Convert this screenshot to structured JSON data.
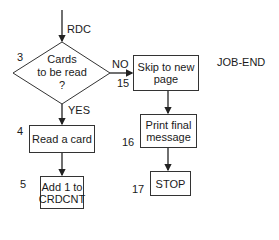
{
  "diagram": {
    "entry_label": "RDC",
    "exit_label": "JOB-END",
    "nodes": [
      {
        "id": "decision",
        "step": "3",
        "text": "Cards\nto be read\n?",
        "shape": "diamond"
      },
      {
        "id": "skip",
        "step": "15",
        "text": "Skip to new\npage",
        "shape": "rect"
      },
      {
        "id": "read",
        "step": "4",
        "text": "Read a card",
        "shape": "rect"
      },
      {
        "id": "print",
        "step": "16",
        "text": "Print final\nmessage",
        "shape": "rect"
      },
      {
        "id": "add",
        "step": "5",
        "text": "Add 1 to\nCRDCNT",
        "shape": "rect"
      },
      {
        "id": "stop",
        "step": "17",
        "text": "STOP",
        "shape": "rect"
      }
    ],
    "edges": [
      {
        "from": "entry",
        "to": "decision",
        "label": ""
      },
      {
        "from": "decision",
        "to": "skip",
        "label": "NO"
      },
      {
        "from": "decision",
        "to": "read",
        "label": "YES"
      },
      {
        "from": "read",
        "to": "add",
        "label": ""
      },
      {
        "from": "skip",
        "to": "print",
        "label": ""
      },
      {
        "from": "print",
        "to": "stop",
        "label": ""
      }
    ],
    "branch_labels": {
      "no": "NO",
      "yes": "YES"
    }
  }
}
